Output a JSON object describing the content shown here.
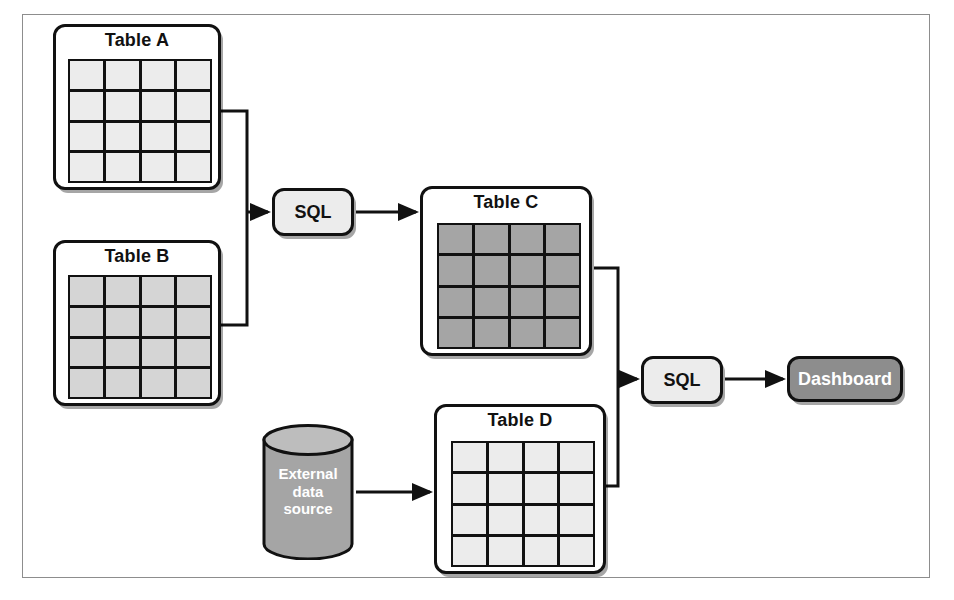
{
  "diagram": {
    "background": "#ffffff",
    "frame_color": "#8d8d8d",
    "line_color": "#111111"
  },
  "tables": [
    {
      "id": "table-a",
      "label": "Table A",
      "rows": 4,
      "cols": 4,
      "cell_color": "#ececec",
      "x": 53,
      "y": 24,
      "w": 168,
      "h": 166,
      "grid_x": 12,
      "grid_y": 32,
      "grid_w": 144,
      "grid_h": 124
    },
    {
      "id": "table-b",
      "label": "Table B",
      "rows": 4,
      "cols": 4,
      "cell_color": "#d5d5d5",
      "x": 53,
      "y": 240,
      "w": 168,
      "h": 166,
      "grid_x": 12,
      "grid_y": 32,
      "grid_w": 144,
      "grid_h": 124
    },
    {
      "id": "table-c",
      "label": "Table C",
      "rows": 4,
      "cols": 4,
      "cell_color": "#a5a5a5",
      "x": 420,
      "y": 186,
      "w": 172,
      "h": 170,
      "grid_x": 14,
      "grid_y": 34,
      "grid_w": 144,
      "grid_h": 126
    },
    {
      "id": "table-d",
      "label": "Table D",
      "rows": 4,
      "cols": 4,
      "cell_color": "#ececec",
      "x": 434,
      "y": 404,
      "w": 172,
      "h": 170,
      "grid_x": 14,
      "grid_y": 34,
      "grid_w": 144,
      "grid_h": 126
    }
  ],
  "processes": [
    {
      "id": "sql-1",
      "label": "SQL",
      "style": "light",
      "fill": "#ececec",
      "text_color": "#111111",
      "x": 272,
      "y": 188,
      "w": 82,
      "h": 48
    },
    {
      "id": "sql-2",
      "label": "SQL",
      "style": "light",
      "fill": "#ececec",
      "text_color": "#111111",
      "x": 641,
      "y": 356,
      "w": 82,
      "h": 48
    },
    {
      "id": "dashboard",
      "label": "Dashboard",
      "style": "dark",
      "fill": "#8d8d8d",
      "text_color": "#ffffff",
      "x": 787,
      "y": 356,
      "w": 116,
      "h": 46
    }
  ],
  "datasource": {
    "id": "external-data-source",
    "label_lines": [
      "External",
      "data",
      "source"
    ],
    "fill": "#a5a5a5",
    "text_color": "#ffffff",
    "x": 262,
    "y": 424,
    "w": 92,
    "h": 136
  }
}
